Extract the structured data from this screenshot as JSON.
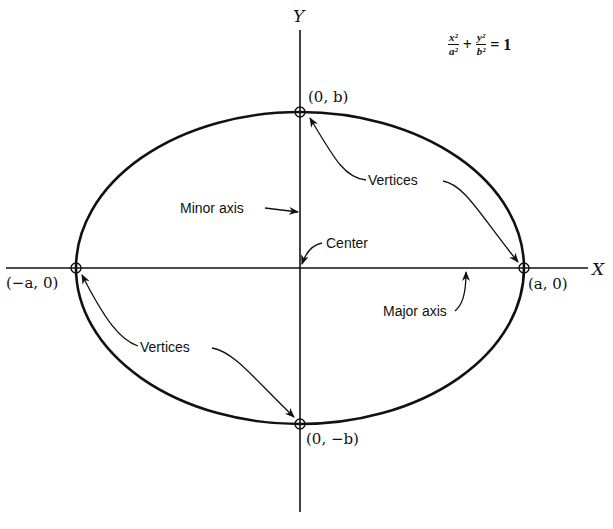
{
  "diagram": {
    "equation": {
      "term1": {
        "numerator": "x²",
        "denominator": "a²"
      },
      "operator": "+",
      "term2": {
        "numerator": "y²",
        "denominator": "b²"
      },
      "equals": "= 1"
    },
    "axes": {
      "x_label": "X",
      "y_label": "Y"
    },
    "points": {
      "top": "(0, b)",
      "bottom": "(0, −b)",
      "left": "(−a, 0)",
      "right": "(a, 0)"
    },
    "annotations": {
      "vertices_upper": "Vertices",
      "vertices_lower": "Vertices",
      "minor_axis": "Minor axis",
      "major_axis": "Major axis",
      "center": "Center"
    },
    "geometry": {
      "center": [
        300,
        268
      ],
      "semi_major_a": 224,
      "semi_minor_b": 156,
      "stroke_color": "#111111"
    }
  }
}
